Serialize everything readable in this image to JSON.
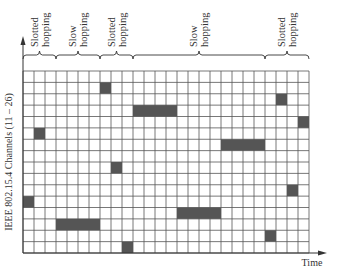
{
  "diagram": {
    "y_axis_label": "IEEE 802.15.4 Channels (11 – 26)",
    "x_axis_label": "Time",
    "grid": {
      "columns": 26,
      "rows": 16,
      "channel_min": 11,
      "channel_max": 26
    },
    "colors": {
      "cell_fill": "#555555",
      "grid_line": "#555555",
      "background": "#ffffff"
    },
    "segments": [
      {
        "label_line1": "Slotted",
        "label_line2": "hopping",
        "start_col": 0,
        "end_col": 3
      },
      {
        "label_line1": "Slow",
        "label_line2": "hopping",
        "start_col": 3,
        "end_col": 7
      },
      {
        "label_line1": "Slotted",
        "label_line2": "hopping",
        "start_col": 7,
        "end_col": 10
      },
      {
        "label_line1": "Slow",
        "label_line2": "hopping",
        "start_col": 10,
        "end_col": 22
      },
      {
        "label_line1": "Slotted",
        "label_line2": "hopping",
        "start_col": 22,
        "end_col": 26
      }
    ],
    "occupied_cells": [
      {
        "col": 0,
        "row": 11,
        "span": 1
      },
      {
        "col": 1,
        "row": 5,
        "span": 1
      },
      {
        "col": 2,
        "row": 5,
        "span": 0
      },
      {
        "col": 3,
        "row": 13,
        "span": 4
      },
      {
        "col": 7,
        "row": 1,
        "span": 1
      },
      {
        "col": 8,
        "row": 8,
        "span": 1
      },
      {
        "col": 9,
        "row": 15,
        "span": 1
      },
      {
        "col": 10,
        "row": 3,
        "span": 4
      },
      {
        "col": 14,
        "row": 12,
        "span": 4
      },
      {
        "col": 18,
        "row": 6,
        "span": 4
      },
      {
        "col": 22,
        "row": 14,
        "span": 1
      },
      {
        "col": 23,
        "row": 2,
        "span": 1
      },
      {
        "col": 24,
        "row": 10,
        "span": 1
      },
      {
        "col": 25,
        "row": 4,
        "span": 1
      }
    ]
  }
}
